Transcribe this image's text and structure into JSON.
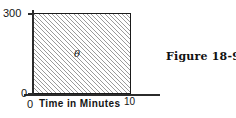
{
  "figure": {
    "caption": "Figure 18-91"
  },
  "chart_data": {
    "type": "area",
    "title": "",
    "xlabel": "Time in Minutes",
    "ylabel": "",
    "xlim": [
      0,
      10
    ],
    "ylim": [
      0,
      300
    ],
    "x_ticks": [
      "0",
      "10"
    ],
    "y_ticks": [
      "0",
      "300"
    ],
    "grid": false,
    "legend": null,
    "series": [
      {
        "name": "shaded-region",
        "x": [
          0,
          10
        ],
        "values": [
          300,
          300
        ],
        "fill": "hatched",
        "annotation": "θ"
      }
    ],
    "annotations": [
      {
        "text": "θ",
        "x": 4.4,
        "y": 160
      }
    ],
    "colors": {
      "axis": "#2b2b2b",
      "border": "#1a1a1a",
      "hatch": "#9a9a9a",
      "background": "#ffffff",
      "text": "#141414"
    }
  }
}
